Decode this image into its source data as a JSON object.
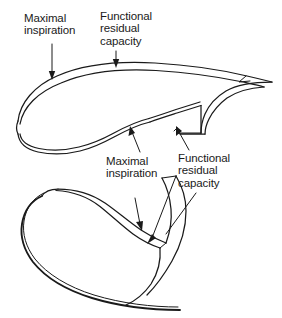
{
  "figure": {
    "stroke_color": "#1a1a1a",
    "background_color": "#ffffff",
    "views": [
      {
        "name": "upper-view",
        "description": "Lateral view of diaphragm dome outlines"
      },
      {
        "name": "lower-view",
        "description": "Oblique / frontal view of diaphragm outlines"
      }
    ]
  },
  "labels": {
    "upper": {
      "maximal_inspiration": "Maximal\ninspiration",
      "functional_residual_capacity": "Functional\nresidual\ncapacity"
    },
    "lower": {
      "maximal_inspiration": "Maximal\ninspiration",
      "functional_residual_capacity": "Functional\nresidual\ncapacity"
    }
  }
}
